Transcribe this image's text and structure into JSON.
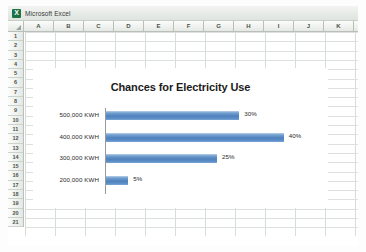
{
  "window": {
    "title": "Microsoft Excel",
    "logo_icon": "excel-green-x-icon"
  },
  "spreadsheet": {
    "columns": [
      "A",
      "B",
      "C",
      "D",
      "E",
      "F",
      "G",
      "H",
      "I",
      "J",
      "K"
    ],
    "rows": [
      "1",
      "2",
      "3",
      "4",
      "5",
      "6",
      "7",
      "8",
      "9",
      "10",
      "11",
      "12",
      "13",
      "14",
      "15",
      "16",
      "17",
      "18",
      "19",
      "20",
      "21"
    ],
    "select_all_icon": "select-all-corner-icon"
  },
  "chart_data": {
    "type": "bar",
    "orientation": "horizontal",
    "title": "Chances for Electricity Use",
    "categories": [
      "500,000 KWH",
      "400,000 KWH",
      "300,000 KWH",
      "200,000 KWH"
    ],
    "values": [
      30,
      40,
      25,
      5
    ],
    "data_labels": [
      "30%",
      "40%",
      "25%",
      "5%"
    ],
    "xlabel": "",
    "ylabel": "",
    "xlim": [
      0,
      45
    ],
    "grid": false,
    "legend": false,
    "series_color": "#4F81BD",
    "plot_background": "#FFFFFF"
  },
  "theme": {
    "bar_color": "#4F81BD",
    "bar_highlight": "#8CB2D9",
    "axis_color": "#9A9A9A",
    "grid_line": "#D8DCD8",
    "header_text": "#4C524C",
    "title_text": "#1C1C1C"
  }
}
